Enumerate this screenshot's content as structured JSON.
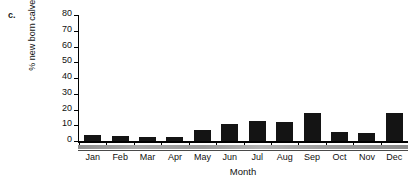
{
  "panel": {
    "label": "c."
  },
  "chart_data": {
    "type": "bar",
    "title": "",
    "subtitle": "",
    "xlabel": "Month",
    "ylabel": "% new born calves",
    "categories": [
      "Jan",
      "Feb",
      "Mar",
      "Apr",
      "May",
      "Jun",
      "Jul",
      "Aug",
      "Sep",
      "Oct",
      "Nov",
      "Dec"
    ],
    "values": [
      4,
      3.5,
      2.5,
      2.5,
      7,
      11,
      13,
      12,
      18,
      6,
      5,
      17.5
    ],
    "series": [
      {
        "name": "% new born calves",
        "values": [
          4,
          3.5,
          2.5,
          2.5,
          7,
          11,
          13,
          12,
          18,
          6,
          5,
          17.5
        ]
      }
    ],
    "ylim": [
      0,
      80
    ],
    "ytick_values": [
      0,
      10,
      20,
      30,
      40,
      50,
      60,
      70,
      80
    ],
    "ytick_labels": [
      "0",
      "10",
      "20",
      "30",
      "40",
      "50",
      "60",
      "70",
      "80"
    ],
    "grid": false,
    "legend": false,
    "legend_position": "none",
    "bar_color": "#141414",
    "axis_color": "#000000",
    "season_band_color": "#9a9a9a"
  }
}
